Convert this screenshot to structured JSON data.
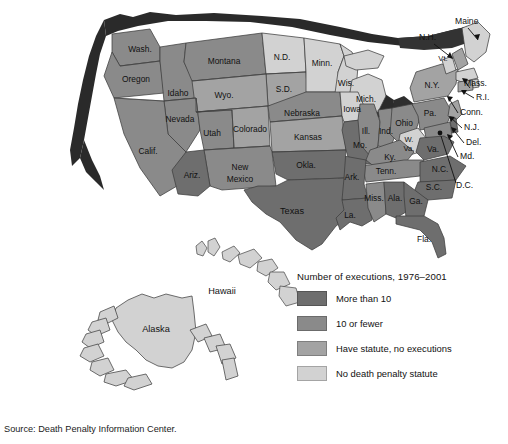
{
  "figure": {
    "source_note": "Source: Death Penalty Information Center."
  },
  "legend": {
    "title": "Number of executions, 1976–2001",
    "items": [
      {
        "label": "More than 10",
        "color": "#6e6e6e",
        "key": "more_than_10"
      },
      {
        "label": "10 or fewer",
        "color": "#8a8a8a",
        "key": "ten_or_fewer"
      },
      {
        "label": "Have statute, no executions",
        "color": "#a3a3a3",
        "key": "statute_no_exec"
      },
      {
        "label": "No death penalty statute",
        "color": "#d2d2d2",
        "key": "no_statute"
      }
    ]
  },
  "map": {
    "type": "choropleth",
    "region": "United States",
    "palette": {
      "more_than_10": "#6e6e6e",
      "ten_or_fewer": "#8a8a8a",
      "statute_no_exec": "#a3a3a3",
      "no_statute": "#d2d2d2",
      "shadow": "#2a2a2a",
      "border": "#3a3a3a",
      "background": "#ffffff"
    },
    "labels": {
      "wash": "Wash.",
      "oregon": "Oregon",
      "idaho": "Idaho",
      "montana": "Montana",
      "nd": "N.D.",
      "minn": "Minn.",
      "wis": "Wis.",
      "mich": "Mich.",
      "sd": "S.D.",
      "wyo": "Wyo.",
      "nevada": "Nevada",
      "calif": "Calif.",
      "utah": "Utah",
      "colorado": "Colorado",
      "nebraska": "Nebraska",
      "iowa": "Iowa",
      "ill": "Ill.",
      "ind": "Ind.",
      "ohio": "Ohio",
      "pa": "Pa.",
      "ny": "N.Y.",
      "kansas": "Kansas",
      "mo": "Mo.",
      "ky": "Ky.",
      "wva": "W.\nVa.",
      "va": "Va.",
      "ariz": "Ariz.",
      "newmexico": "New\nMexico",
      "okla": "Okla.",
      "ark": "Ark.",
      "tenn": "Tenn.",
      "nc": "N.C.",
      "sc": "S.C.",
      "miss": "Miss.",
      "ala": "Ala.",
      "ga": "Ga.",
      "la": "La.",
      "texas": "Texas",
      "fla": "Fla.",
      "hawaii": "Hawaii",
      "alaska": "Alaska",
      "vt": "Vt."
    },
    "callouts": [
      {
        "label": "Maine",
        "key": "maine"
      },
      {
        "label": "N.H.",
        "key": "nh"
      },
      {
        "label": "Mass.",
        "key": "mass"
      },
      {
        "label": "R.I.",
        "key": "ri"
      },
      {
        "label": "Conn.",
        "key": "conn"
      },
      {
        "label": "N.J.",
        "key": "nj"
      },
      {
        "label": "Del.",
        "key": "del"
      },
      {
        "label": "Md.",
        "key": "md"
      },
      {
        "label": "D.C.",
        "key": "dc"
      }
    ],
    "state_categories": {
      "Washington": "ten_or_fewer",
      "Oregon": "ten_or_fewer",
      "Idaho": "ten_or_fewer",
      "Montana": "ten_or_fewer",
      "Wyoming": "statute_no_exec",
      "Nevada": "ten_or_fewer",
      "California": "ten_or_fewer",
      "Utah": "ten_or_fewer",
      "Colorado": "statute_no_exec",
      "Arizona": "more_than_10",
      "New Mexico": "ten_or_fewer",
      "North Dakota": "no_statute",
      "South Dakota": "statute_no_exec",
      "Nebraska": "ten_or_fewer",
      "Kansas": "statute_no_exec",
      "Oklahoma": "more_than_10",
      "Texas": "more_than_10",
      "Minnesota": "no_statute",
      "Iowa": "no_statute",
      "Missouri": "more_than_10",
      "Arkansas": "more_than_10",
      "Louisiana": "more_than_10",
      "Wisconsin": "no_statute",
      "Illinois": "ten_or_fewer",
      "Michigan": "no_statute",
      "Indiana": "ten_or_fewer",
      "Ohio": "ten_or_fewer",
      "Kentucky": "ten_or_fewer",
      "Tennessee": "ten_or_fewer",
      "Mississippi": "ten_or_fewer",
      "Alabama": "more_than_10",
      "Georgia": "more_than_10",
      "Florida": "more_than_10",
      "South Carolina": "more_than_10",
      "North Carolina": "more_than_10",
      "Virginia": "more_than_10",
      "West Virginia": "no_statute",
      "Pennsylvania": "ten_or_fewer",
      "New York": "statute_no_exec",
      "Vermont": "no_statute",
      "Maine": "no_statute",
      "New Hampshire": "statute_no_exec",
      "Massachusetts": "no_statute",
      "Rhode Island": "no_statute",
      "Connecticut": "statute_no_exec",
      "New Jersey": "statute_no_exec",
      "Delaware": "more_than_10",
      "Maryland": "ten_or_fewer",
      "District of Columbia": "no_statute",
      "Alaska": "no_statute",
      "Hawaii": "no_statute"
    }
  }
}
